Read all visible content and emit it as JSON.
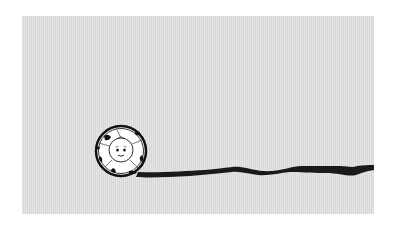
{
  "scene": {
    "description": "Cartoon ball with face rolling, leaving a black ink trail",
    "background_color": "#dcdcdc",
    "trail_color": "#1a1a1a",
    "ball": {
      "center_x": 121,
      "center_y": 151,
      "radius": 25,
      "face": "smiling face"
    }
  }
}
